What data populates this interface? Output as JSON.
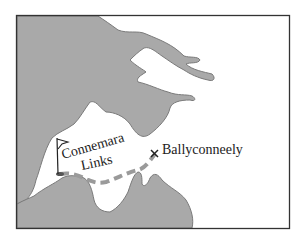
{
  "map": {
    "colors": {
      "land": "#a9a9a9",
      "water": "#ffffff",
      "frame": "#333333",
      "route": "#9a9a9a"
    },
    "places": [
      {
        "name": "Connemara Links",
        "line1": "Connemara",
        "line2": "Links",
        "marker": "flag"
      },
      {
        "name": "Ballyconneely",
        "marker": "x"
      }
    ]
  }
}
